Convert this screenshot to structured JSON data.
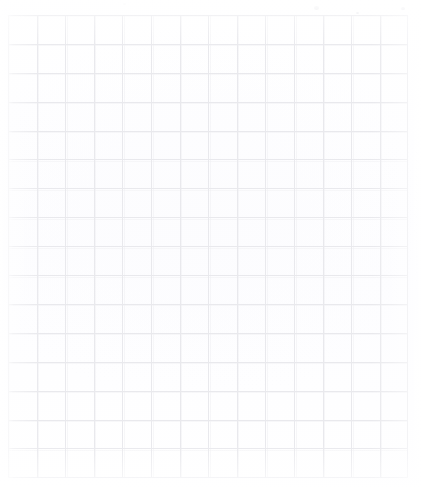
{
  "document": {
    "kind": "scanned-sheet",
    "description": "Blank ruled graph / grid paper, scanned",
    "content_text": "",
    "has_writing": false,
    "page_width": 422,
    "page_height": 488,
    "background_color": "#ffffff",
    "paper_color": "#fefeff"
  },
  "grid": {
    "name": "graph-paper-ruling",
    "origin_x": 8,
    "origin_y": 15,
    "right_edge": 408,
    "bottom_edge": 478,
    "width": 400,
    "height": 463,
    "columns": 14,
    "rows": 16,
    "cell_width": 28.6,
    "cell_height": 28.9,
    "line_color": "#e9e9ed",
    "ghost_line_color": "#f0f0f3",
    "border_color": "#e7e7ec",
    "line_width_px": 1
  },
  "margins": {
    "left_label": "left margin",
    "top_label": "top margin",
    "right_label": "right margin",
    "bottom_label": "bottom margin",
    "left_width": 8,
    "top_height": 15,
    "right_width": 14,
    "bottom_height": 10
  },
  "artifacts": {
    "label": "scan specks",
    "specks": [
      {
        "x": 314,
        "y": 6,
        "w": 5,
        "h": 4,
        "color": "#f2f2f4"
      },
      {
        "x": 401,
        "y": 7,
        "w": 4,
        "h": 3,
        "color": "#f4f4f6"
      },
      {
        "x": 123,
        "y": 3,
        "w": 3,
        "h": 2,
        "color": "#f5f5f7"
      },
      {
        "x": 356,
        "y": 12,
        "w": 3,
        "h": 2,
        "color": "#f4f4f6"
      }
    ]
  }
}
